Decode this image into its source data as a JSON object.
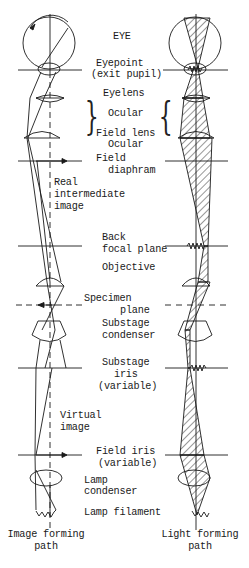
{
  "labels": {
    "eye": "EYE",
    "eyepoint": "Eyepoint",
    "exit_pupil": "(exit pupil)",
    "eyelens": "Eyelens",
    "ocular_group": "Ocular",
    "field_lens": "Field lens",
    "ocular": "Ocular",
    "field_diaphragm_1": "Field",
    "field_diaphragm_2": "diaphram",
    "real_image_1": "Real",
    "real_image_2": "intermediate",
    "real_image_3": "image",
    "back_focal_1": "Back",
    "back_focal_2": "focal plane",
    "objective": "Objective",
    "specimen_1": "Specimen",
    "specimen_2": "plane",
    "condenser_1": "Substage",
    "condenser_2": "condenser",
    "substage_iris_1": "Substage",
    "substage_iris_2": "iris",
    "substage_iris_3": "(variable)",
    "virtual_1": "Virtual",
    "virtual_2": "image",
    "field_iris_1": "Field iris",
    "field_iris_2": "(variable)",
    "lamp_condenser_1": "Lamp",
    "lamp_condenser_2": "condenser",
    "lamp_filament": "Lamp filament"
  },
  "captions": {
    "left_1": "Image forming",
    "left_2": "path",
    "right_1": "Light forming",
    "right_2": "path"
  },
  "colors": {
    "line": "#1a1a1a",
    "background": "#ffffff"
  }
}
